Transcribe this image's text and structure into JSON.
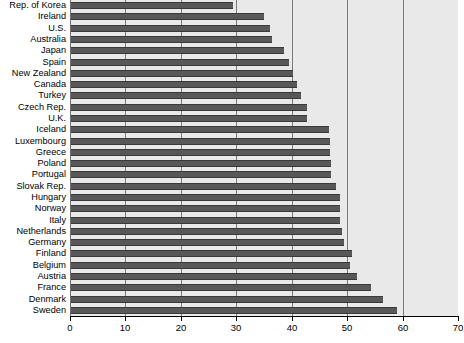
{
  "chart_data": {
    "type": "bar",
    "orientation": "horizontal",
    "title": "",
    "subtitle": "",
    "xlabel": "",
    "ylabel": "",
    "xlim": [
      0,
      70
    ],
    "ylim": null,
    "grid": true,
    "grid_axis": "x",
    "legend": null,
    "legend_position": "none",
    "xticks": [
      0,
      10,
      20,
      30,
      40,
      50,
      60,
      70
    ],
    "xtick_labels": [
      "0",
      "10",
      "20",
      "30",
      "40",
      "50",
      "60",
      "70"
    ],
    "bar_color": "#585858",
    "plot_background": "#e9e9e9",
    "gridline_color": "#7a7a7a",
    "categories": [
      "Rep. of Korea",
      "Ireland",
      "U.S.",
      "Australia",
      "Japan",
      "Spain",
      "New Zealand",
      "Canada",
      "Turkey",
      "Czech Rep.",
      "U.K.",
      "Iceland",
      "Luxembourg",
      "Greece",
      "Poland",
      "Portugal",
      "Slovak Rep.",
      "Hungary",
      "Norway",
      "Italy",
      "Netherlands",
      "Germany",
      "Finland",
      "Belgium",
      "Austria",
      "France",
      "Denmark",
      "Sweden"
    ],
    "values": [
      29.4,
      35.0,
      36.0,
      36.5,
      38.6,
      39.5,
      40.2,
      41.0,
      41.7,
      42.8,
      42.8,
      46.7,
      46.9,
      46.9,
      47.1,
      47.1,
      47.9,
      48.7,
      48.7,
      48.8,
      49.1,
      49.4,
      50.8,
      50.5,
      51.7,
      54.3,
      56.5,
      59.0
    ]
  }
}
